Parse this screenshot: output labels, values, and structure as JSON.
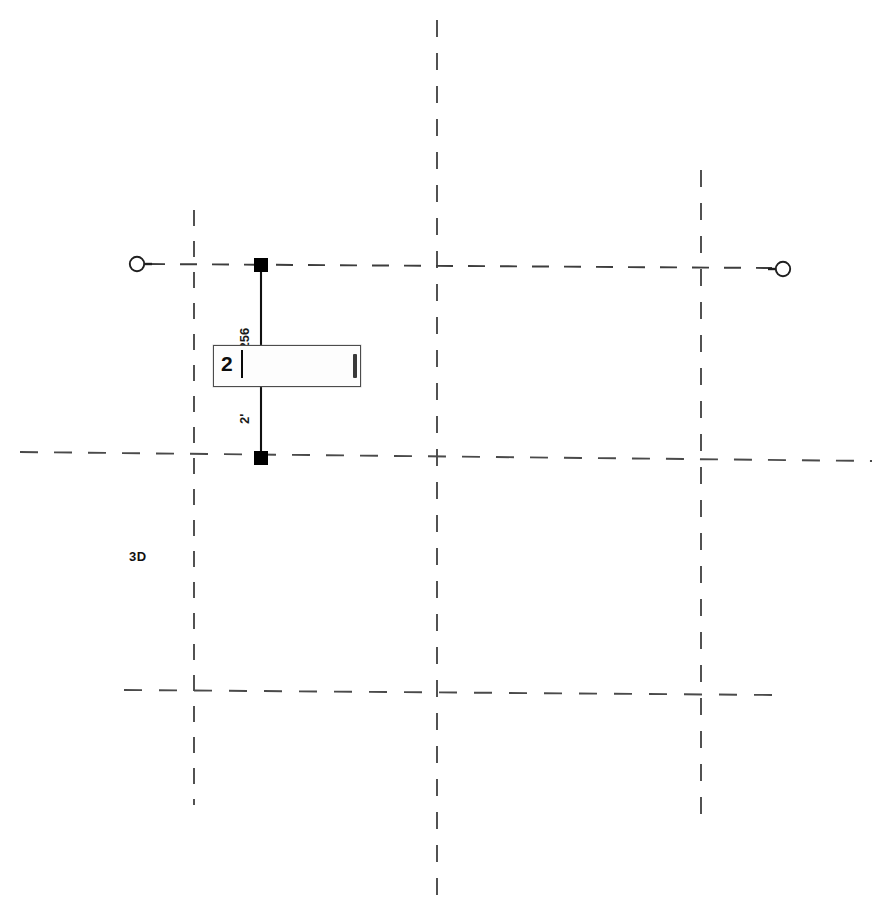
{
  "document": {
    "type": "architectural-plan",
    "view_mode_label": "3D",
    "background_color": "#ffffff",
    "grid_line_color": "#4a4a4a",
    "annotation_color": "#111111",
    "selected_element_color": "#000000"
  },
  "dimension_edit": {
    "input_value": "2",
    "placeholder": "",
    "caret_visible": true,
    "scroll_grip": true
  },
  "dimension_labels": [
    {
      "id": "upper-segment",
      "text": "/256",
      "rotation": -90
    },
    {
      "id": "lower-segment",
      "text": "2'",
      "rotation": -90
    }
  ],
  "dimension_line": {
    "witness_left_label": "",
    "witness_right_label": "",
    "grip_top": {
      "x": 261,
      "y": 265
    },
    "grip_bottom": {
      "x": 261,
      "y": 458
    },
    "bubble_left": {
      "x": 137,
      "y": 264
    },
    "bubble_right": {
      "x": 783,
      "y": 269
    }
  },
  "grid": {
    "vertical_lines": [
      {
        "id": "grid-line-a",
        "x": 194,
        "y1": 210,
        "y2": 805
      },
      {
        "id": "grid-line-b",
        "x": 437,
        "y1": 20,
        "y2": 898
      },
      {
        "id": "grid-line-c",
        "x": 701,
        "y1": 170,
        "y2": 828
      }
    ],
    "horizontal_lines": [
      {
        "id": "grid-line-1",
        "x1": 150,
        "y1": 264,
        "x2": 770,
        "y2": 268
      },
      {
        "id": "grid-line-2",
        "x1": 20,
        "y1": 452,
        "x2": 872,
        "y2": 461
      },
      {
        "id": "grid-line-3",
        "x1": 124,
        "y1": 690,
        "x2": 776,
        "y2": 695
      }
    ]
  }
}
